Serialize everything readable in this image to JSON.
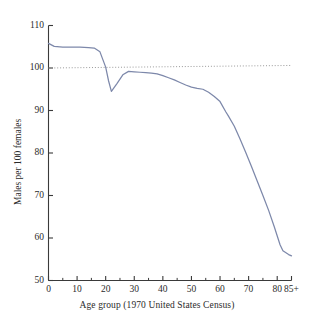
{
  "chart_data": {
    "type": "line",
    "title": "",
    "subtitle": "",
    "xlabel": "Age group (1970 United States Census)",
    "ylabel": "Males per 100 females",
    "xlim": [
      0,
      85
    ],
    "ylim": [
      50,
      110
    ],
    "grid": false,
    "legend_position": "none",
    "x_tick_labels": [
      "0",
      "10",
      "20",
      "30",
      "40",
      "50",
      "60",
      "70",
      "80",
      "85+"
    ],
    "x_tick_values": [
      0,
      10,
      20,
      30,
      40,
      50,
      60,
      70,
      80,
      85
    ],
    "x_minor_tick_values": [
      5,
      15,
      25,
      35,
      45,
      55,
      65,
      75
    ],
    "y_tick_labels": [
      "110",
      "100",
      "90",
      "80",
      "70",
      "60",
      "50"
    ],
    "y_tick_values": [
      110,
      100,
      90,
      80,
      70,
      60,
      50
    ],
    "series": [
      {
        "name": "Males per 100 females",
        "color": "#7d88aa",
        "x": [
          0,
          2,
          5,
          8,
          11,
          14,
          16,
          18,
          20,
          21,
          22,
          24,
          26,
          28,
          30,
          32,
          34,
          36,
          38,
          40,
          42,
          44,
          46,
          48,
          50,
          52,
          54,
          56,
          58,
          60,
          62,
          63,
          65,
          67,
          69,
          71,
          73,
          75,
          77,
          79,
          81,
          82,
          84,
          85
        ],
        "values": [
          105.8,
          105.1,
          104.9,
          104.9,
          104.9,
          104.8,
          104.7,
          103.8,
          100.2,
          97.0,
          94.5,
          96.4,
          98.4,
          99.2,
          99.1,
          99.0,
          98.9,
          98.8,
          98.6,
          98.2,
          97.7,
          97.2,
          96.6,
          96.0,
          95.5,
          95.2,
          95.0,
          94.3,
          93.3,
          92.1,
          89.7,
          88.6,
          86.3,
          83.3,
          80.1,
          76.8,
          73.4,
          70.0,
          66.5,
          62.6,
          58.4,
          57.0,
          56.1,
          55.8
        ]
      },
      {
        "name": "Reference line at 100",
        "style": "dotted",
        "color": "#9a9a9a",
        "x": [
          0,
          85
        ],
        "values": [
          100.0,
          100.6
        ]
      }
    ],
    "annotations": [
      "Curve starts at about 106 males per 100 females at age 0",
      "Local minimum of about 94.5 near age 22",
      "Local maximum of about 99 near age 28",
      "Steep decline after age 60 reaching about 56 at age 85+"
    ],
    "reference_line_value": 100
  },
  "axes": {
    "y_title": "Males per 100 females",
    "x_title": "Age group (1970 United States Census)"
  },
  "colors": {
    "line": "#7d88aa",
    "reference": "#9a9a9a",
    "axis": "#3a3a3a",
    "text": "#2b2b2b",
    "background": "#ffffff"
  }
}
